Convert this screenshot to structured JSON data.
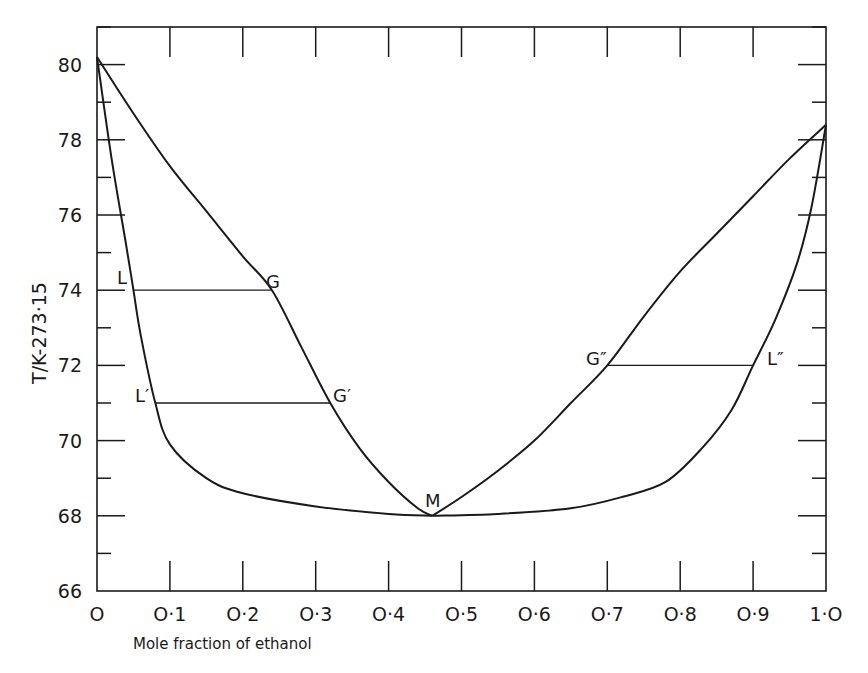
{
  "chart_data": {
    "type": "line",
    "title": "",
    "xlabel": "Mole fraction of ethanol",
    "ylabel": "T/K-273·15",
    "xlim": [
      0,
      1.0
    ],
    "ylim": [
      66,
      81
    ],
    "grid": false,
    "legend": null,
    "x_ticks": [
      "O",
      "O·1",
      "O·2",
      "O·3",
      "O·4",
      "O·5",
      "O·6",
      "O·7",
      "O·8",
      "O·9",
      "1·O"
    ],
    "x_tick_values": [
      0,
      0.1,
      0.2,
      0.3,
      0.4,
      0.5,
      0.6,
      0.7,
      0.8,
      0.9,
      1.0
    ],
    "y_ticks": [
      "66",
      "68",
      "70",
      "72",
      "74",
      "76",
      "78",
      "80"
    ],
    "y_tick_values": [
      66,
      68,
      70,
      72,
      74,
      76,
      78,
      80
    ],
    "series": [
      {
        "name": "Liquid curve (left branch)",
        "x": [
          0,
          0.02,
          0.04,
          0.05,
          0.06,
          0.08,
          0.1,
          0.15,
          0.2,
          0.3,
          0.4,
          0.46
        ],
        "y": [
          80.2,
          77.5,
          75.2,
          74.0,
          72.8,
          71.0,
          69.9,
          69.0,
          68.6,
          68.25,
          68.05,
          68.0
        ]
      },
      {
        "name": "Vapour curve (left branch)",
        "x": [
          0,
          0.05,
          0.1,
          0.15,
          0.2,
          0.24,
          0.28,
          0.32,
          0.36,
          0.4,
          0.44,
          0.46
        ],
        "y": [
          80.2,
          78.7,
          77.3,
          76.1,
          74.9,
          74.0,
          72.5,
          71.0,
          69.8,
          68.9,
          68.2,
          68.0
        ]
      },
      {
        "name": "Vapour curve (right branch)",
        "x": [
          0.46,
          0.5,
          0.55,
          0.6,
          0.65,
          0.7,
          0.75,
          0.8,
          0.85,
          0.9,
          0.95,
          1.0
        ],
        "y": [
          68.0,
          68.5,
          69.2,
          70.0,
          71.0,
          72.0,
          73.3,
          74.5,
          75.5,
          76.5,
          77.5,
          78.4
        ]
      },
      {
        "name": "Liquid curve (right branch)",
        "x": [
          0.46,
          0.55,
          0.65,
          0.72,
          0.78,
          0.83,
          0.87,
          0.9,
          0.93,
          0.96,
          0.98,
          1.0
        ],
        "y": [
          68.0,
          68.05,
          68.2,
          68.5,
          68.9,
          69.8,
          70.8,
          72.0,
          73.2,
          74.7,
          76.2,
          78.4
        ]
      }
    ],
    "tie_lines": [
      {
        "from_label": "L",
        "to_label": "G",
        "x_from": 0.05,
        "x_to": 0.24,
        "y": 74
      },
      {
        "from_label": "L′",
        "to_label": "G′",
        "x_from": 0.08,
        "x_to": 0.32,
        "y": 71
      },
      {
        "from_label": "G″",
        "to_label": "L″",
        "x_from": 0.7,
        "x_to": 0.9,
        "y": 72
      }
    ],
    "annotations": [
      {
        "text": "L",
        "x": 0.05,
        "y": 74
      },
      {
        "text": "G",
        "x": 0.24,
        "y": 74
      },
      {
        "text": "L′",
        "x": 0.08,
        "y": 71
      },
      {
        "text": "G′",
        "x": 0.32,
        "y": 71
      },
      {
        "text": "M",
        "x": 0.46,
        "y": 68
      },
      {
        "text": "G″",
        "x": 0.7,
        "y": 72
      },
      {
        "text": "L″",
        "x": 0.9,
        "y": 72
      }
    ],
    "extremes": {
      "pure_component_A_boiling": 80.2,
      "pure_ethanol_boiling": 78.4,
      "azeotrope_M": {
        "x": 0.46,
        "y": 68.0
      }
    }
  },
  "labels": {
    "xlabel": "Mole fraction of ethanol",
    "ylabel": "T/K-273·15",
    "x_ticks": [
      "O",
      "O·1",
      "O·2",
      "O·3",
      "O·4",
      "O·5",
      "O·6",
      "O·7",
      "O·8",
      "O·9",
      "1·O"
    ],
    "y_ticks": [
      "66",
      "68",
      "70",
      "72",
      "74",
      "76",
      "78",
      "80"
    ],
    "points": {
      "L": "L",
      "G": "G",
      "L1": "L′",
      "G1": "G′",
      "M": "M",
      "G2": "G″",
      "L2": "L″"
    }
  }
}
